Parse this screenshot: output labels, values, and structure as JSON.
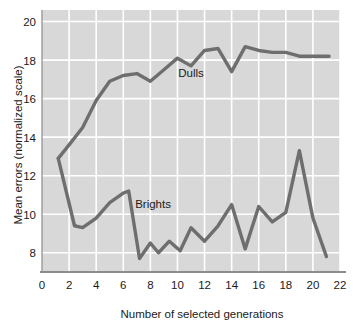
{
  "chart_data": {
    "type": "line",
    "title": "",
    "xlabel": "Number of selected generations",
    "ylabel": "Mean errors (normalized scale)",
    "xlim": [
      0,
      22
    ],
    "ylim": [
      7,
      20.6
    ],
    "xticks": [
      0,
      2,
      4,
      6,
      8,
      10,
      12,
      14,
      16,
      18,
      20,
      22
    ],
    "xtick_labels": [
      "0",
      "2",
      "4",
      "6",
      "8",
      "10",
      "12",
      "14",
      "16",
      "18",
      "20",
      "22"
    ],
    "yticks": [
      8,
      10,
      12,
      14,
      16,
      18,
      20
    ],
    "ytick_labels": [
      "8",
      "10",
      "12",
      "14",
      "16",
      "18",
      "20"
    ],
    "grid": true,
    "grid_color": "#ffffff",
    "plot_background": "#d8d8d8",
    "line_color": "#6e6e6e",
    "legend": "inline-labels",
    "series": [
      {
        "name": "Dulls",
        "label_x": 11.0,
        "label_y": 17.1,
        "points": [
          {
            "x": 1.2,
            "y": 12.9
          },
          {
            "x": 2.0,
            "y": 13.6
          },
          {
            "x": 3.0,
            "y": 14.5
          },
          {
            "x": 4.0,
            "y": 15.9
          },
          {
            "x": 5.0,
            "y": 16.9
          },
          {
            "x": 6.0,
            "y": 17.2
          },
          {
            "x": 7.0,
            "y": 17.3
          },
          {
            "x": 8.0,
            "y": 16.9
          },
          {
            "x": 9.0,
            "y": 17.5
          },
          {
            "x": 10.0,
            "y": 18.1
          },
          {
            "x": 11.0,
            "y": 17.7
          },
          {
            "x": 12.0,
            "y": 18.5
          },
          {
            "x": 13.0,
            "y": 18.6
          },
          {
            "x": 14.0,
            "y": 17.4
          },
          {
            "x": 15.0,
            "y": 18.7
          },
          {
            "x": 16.0,
            "y": 18.5
          },
          {
            "x": 17.0,
            "y": 18.4
          },
          {
            "x": 18.0,
            "y": 18.4
          },
          {
            "x": 19.0,
            "y": 18.2
          },
          {
            "x": 21.2,
            "y": 18.2
          }
        ]
      },
      {
        "name": "Brights",
        "label_x": 8.2,
        "label_y": 10.3,
        "points": [
          {
            "x": 1.2,
            "y": 12.9
          },
          {
            "x": 2.4,
            "y": 9.4
          },
          {
            "x": 3.0,
            "y": 9.3
          },
          {
            "x": 4.0,
            "y": 9.8
          },
          {
            "x": 5.0,
            "y": 10.6
          },
          {
            "x": 6.0,
            "y": 11.1
          },
          {
            "x": 6.4,
            "y": 11.2
          },
          {
            "x": 7.2,
            "y": 7.7
          },
          {
            "x": 8.0,
            "y": 8.5
          },
          {
            "x": 8.6,
            "y": 8.0
          },
          {
            "x": 9.4,
            "y": 8.6
          },
          {
            "x": 10.2,
            "y": 8.1
          },
          {
            "x": 11.0,
            "y": 9.3
          },
          {
            "x": 12.0,
            "y": 8.6
          },
          {
            "x": 13.0,
            "y": 9.4
          },
          {
            "x": 14.0,
            "y": 10.5
          },
          {
            "x": 15.0,
            "y": 8.2
          },
          {
            "x": 16.0,
            "y": 10.4
          },
          {
            "x": 17.0,
            "y": 9.6
          },
          {
            "x": 18.0,
            "y": 10.1
          },
          {
            "x": 19.0,
            "y": 13.3
          },
          {
            "x": 20.0,
            "y": 9.8
          },
          {
            "x": 21.0,
            "y": 7.8
          }
        ]
      }
    ]
  }
}
